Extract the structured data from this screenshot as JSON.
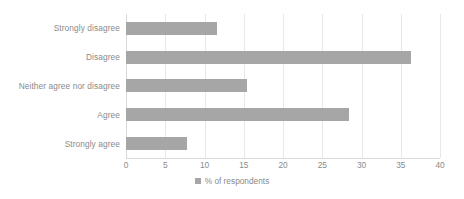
{
  "chart_data": {
    "type": "bar",
    "orientation": "horizontal",
    "title": "",
    "xlabel": "",
    "ylabel": "",
    "categories": [
      "Strongly disagree",
      "Disagree",
      "Neither agree nor disagree",
      "Agree",
      "Strongly agree"
    ],
    "values": [
      11.6,
      36.3,
      15.4,
      28.4,
      7.8
    ],
    "series": [
      {
        "name": "% of respondents",
        "values": [
          11.6,
          36.3,
          15.4,
          28.4,
          7.8
        ]
      }
    ],
    "xlim": [
      0,
      40
    ],
    "xticks": [
      0,
      5,
      10,
      15,
      20,
      25,
      30,
      35,
      40
    ],
    "xtick_labels": [
      "0",
      "5",
      "10",
      "15",
      "20",
      "25",
      "30",
      "35",
      "40"
    ],
    "grid": true,
    "grid_axis": "x",
    "legend": {
      "position": "bottom",
      "entries": [
        {
          "label": "% of respondents",
          "color": "#a6a6a6"
        }
      ]
    },
    "colors": {
      "bar": "#a6a6a6",
      "gridline": "#e8e8e8",
      "axis": "#d9d9d9",
      "text": "#8a8a8a",
      "background": "#ffffff"
    }
  }
}
